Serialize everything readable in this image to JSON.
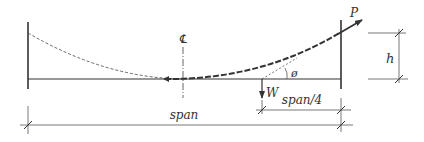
{
  "diagram": {
    "colors": {
      "ink": "#333333",
      "light_ink": "#555555",
      "background": "#ffffff"
    },
    "labels": {
      "centerline": "℄",
      "tension": "P",
      "weight": "W",
      "angle": "ø",
      "height": "h",
      "quarter_span": "span/4",
      "span": "span"
    }
  }
}
